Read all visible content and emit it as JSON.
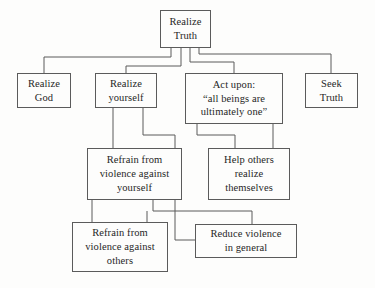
{
  "diagram": {
    "background_color": "#fdfdfc",
    "line_color": "#5b5b5b",
    "text_color": "#262626",
    "nodes": [
      {
        "id": "realize-truth",
        "label": "Realize\nTruth",
        "x": 160,
        "y": 10,
        "w": 51,
        "h": 38
      },
      {
        "id": "realize-god",
        "label": "Realize\nGod",
        "x": 17,
        "y": 73,
        "w": 54,
        "h": 35
      },
      {
        "id": "realize-yourself",
        "label": "Realize\nyourself",
        "x": 95,
        "y": 73,
        "w": 62,
        "h": 35
      },
      {
        "id": "act-upon",
        "label": "Act upon:\n“all beings are\nultimately one”",
        "x": 185,
        "y": 73,
        "w": 98,
        "h": 51
      },
      {
        "id": "seek-truth",
        "label": "Seek\nTruth",
        "x": 305,
        "y": 73,
        "w": 53,
        "h": 35
      },
      {
        "id": "refrain-violence-self",
        "label": "Refrain from\nviolence against\nyourself",
        "x": 87,
        "y": 148,
        "w": 95,
        "h": 52
      },
      {
        "id": "help-others",
        "label": "Help others\nrealize\nthemselves",
        "x": 208,
        "y": 148,
        "w": 82,
        "h": 52
      },
      {
        "id": "refrain-violence-others",
        "label": "Refrain from\nviolence against\nothers",
        "x": 72,
        "y": 222,
        "w": 96,
        "h": 50
      },
      {
        "id": "reduce-violence",
        "label": "Reduce violence\nin general",
        "x": 195,
        "y": 224,
        "w": 102,
        "h": 34
      }
    ],
    "edges": [
      {
        "id": "root-to-realize-god",
        "from": "realize-truth",
        "to": "realize-god",
        "path": "M 171 48 L 171 57 L 44 57 L 44 73"
      },
      {
        "id": "root-to-realize-yourself",
        "from": "realize-truth",
        "to": "realize-yourself",
        "path": "M 181 48 L 181 66 L 126 66 L 126 73"
      },
      {
        "id": "root-to-act-upon",
        "from": "realize-truth",
        "to": "act-upon",
        "path": "M 190 48 L 190 62 L 234 62 L 234 73"
      },
      {
        "id": "root-to-seek-truth",
        "from": "realize-truth",
        "to": "seek-truth",
        "path": "M 199 48 L 199 54 L 331 54 L 331 73"
      },
      {
        "id": "yourself-to-refrain-self",
        "from": "realize-yourself",
        "to": "refrain-violence-self",
        "path": "M 113 108 L 113 148"
      },
      {
        "id": "yourself-to-bus",
        "from": "realize-yourself",
        "to": "reduce-violence",
        "path": "M 143 108 L 143 135 L 175 135 L 175 240 L 195 240"
      },
      {
        "id": "act-to-bus-left",
        "from": "act-upon",
        "to": "help-others",
        "path": "M 197 124 L 197 135 L 235 135 L 235 148"
      },
      {
        "id": "act-to-help-others",
        "from": "act-upon",
        "to": "help-others",
        "path": "M 273 124 L 273 148"
      },
      {
        "id": "refrain-self-to-others",
        "from": "refrain-violence-self",
        "to": "refrain-violence-others",
        "path": "M 92 200 L 92 222"
      },
      {
        "id": "refrain-self-to-bus",
        "from": "refrain-violence-self",
        "to": "reduce-violence",
        "path": "M 153 200 L 153 211 L 252 211 L 252 224"
      },
      {
        "id": "bus-to-refrain-others",
        "from": "refrain-violence-self",
        "to": "refrain-violence-others",
        "path": "M 147 211 L 147 222"
      }
    ]
  }
}
